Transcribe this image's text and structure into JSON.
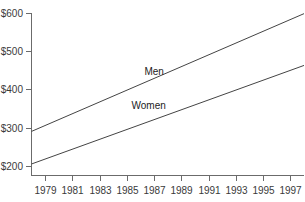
{
  "chart_data": {
    "type": "line",
    "title": "",
    "subtitle": "",
    "xlabel": "",
    "ylabel": "",
    "xlim": [
      1978,
      1998
    ],
    "ylim": [
      175,
      600
    ],
    "grid": false,
    "legend_position": "inline-annotation",
    "x_tick_labels": [
      "1979",
      "1981",
      "1983",
      "1985",
      "1987",
      "1989",
      "1991",
      "1993",
      "1995",
      "1997"
    ],
    "x_tick_values": [
      1979,
      1981,
      1983,
      1985,
      1987,
      1989,
      1991,
      1993,
      1995,
      1997
    ],
    "y_tick_labels": [
      "$200",
      "$300",
      "$400",
      "$500",
      "$600"
    ],
    "y_tick_values": [
      200,
      300,
      400,
      500,
      600
    ],
    "x": [
      1978,
      1998
    ],
    "series": [
      {
        "name": "Men",
        "label": "Men",
        "values": [
          290,
          597
        ],
        "color": "#444444",
        "annotation_x": 1987.0,
        "annotation_y": 437
      },
      {
        "name": "Women",
        "label": "Women",
        "values": [
          205,
          462
        ],
        "color": "#444444",
        "annotation_x": 1986.6,
        "annotation_y": 348
      }
    ],
    "annotations": [
      {
        "text": "Men",
        "x": 1987.0,
        "y": 437
      },
      {
        "text": "Women",
        "x": 1986.6,
        "y": 348
      }
    ],
    "colors": {
      "axis": "#6b6b6b",
      "line": "#444444",
      "tick_label": "#3a3a3a",
      "annotation": "#1c1c1c",
      "background": "#ffffff"
    }
  }
}
